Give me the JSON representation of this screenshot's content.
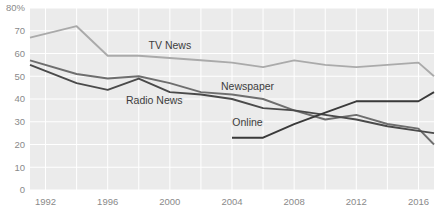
{
  "chart_data": {
    "type": "line",
    "title": "",
    "subtitle": "",
    "xlabel": "",
    "ylabel": "",
    "xlim": [
      1991,
      2017
    ],
    "ylim": [
      0,
      80
    ],
    "grid": true,
    "legend_position": "inline-labels",
    "x_ticks": [
      "1992",
      "1996",
      "2000",
      "2004",
      "2008",
      "2012",
      "2016"
    ],
    "x_tick_values": [
      1992,
      1996,
      2000,
      2004,
      2008,
      2012,
      2016
    ],
    "y_ticks": [
      "0",
      "10",
      "20",
      "30",
      "40",
      "50",
      "60",
      "70",
      "80%"
    ],
    "y_tick_values": [
      0,
      10,
      20,
      30,
      40,
      50,
      60,
      70,
      80
    ],
    "series": [
      {
        "name": "TV News",
        "color": "#aaaaaa",
        "label_x": 2000,
        "label_y": 62,
        "x": [
          1991,
          1994,
          1996,
          1998,
          2000,
          2002,
          2004,
          2006,
          2008,
          2010,
          2012,
          2014,
          2016,
          2017
        ],
        "values": [
          67,
          72,
          59,
          59,
          58,
          57,
          56,
          54,
          57,
          55,
          54,
          55,
          56,
          50
        ]
      },
      {
        "name": "Newspaper",
        "color": "#6e6e6e",
        "label_x": 2005,
        "label_y": 44,
        "x": [
          1991,
          1994,
          1996,
          1998,
          2000,
          2002,
          2004,
          2006,
          2008,
          2010,
          2012,
          2014,
          2016,
          2017
        ],
        "values": [
          57,
          51,
          49,
          50,
          47,
          43,
          42,
          40,
          35,
          31,
          33,
          29,
          27,
          20
        ]
      },
      {
        "name": "Radio News",
        "color": "#4a4a4a",
        "label_x": 1999,
        "label_y": 38,
        "x": [
          1991,
          1994,
          1996,
          1998,
          2000,
          2002,
          2004,
          2006,
          2008,
          2010,
          2012,
          2014,
          2016,
          2017
        ],
        "values": [
          55,
          47,
          44,
          49,
          43,
          42,
          40,
          36,
          35,
          33,
          31,
          28,
          26,
          25
        ]
      },
      {
        "name": "Online",
        "color": "#3a3a3a",
        "label_x": 2005,
        "label_y": 28,
        "x": [
          2004,
          2006,
          2008,
          2010,
          2012,
          2014,
          2016,
          2017
        ],
        "values": [
          23,
          23,
          29,
          34,
          39,
          39,
          39,
          43
        ]
      }
    ]
  }
}
